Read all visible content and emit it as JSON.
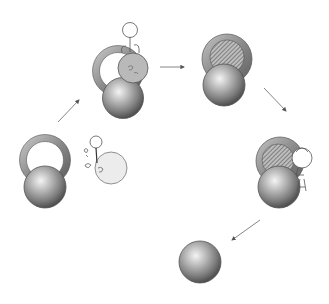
{
  "diagram": {
    "type": "cycle",
    "stages": [
      {
        "id": 1,
        "label": "ring-and-sphere with separate small cell",
        "ring_fill": "open",
        "attached_cell": "separate"
      },
      {
        "id": 2,
        "label": "cell attaching to ring",
        "ring_fill": "open",
        "attached_cell": "merging"
      },
      {
        "id": 3,
        "label": "ring filled (hatched)",
        "ring_fill": "hatched",
        "attached_cell": "none"
      },
      {
        "id": 4,
        "label": "hatched ring with cell at side",
        "ring_fill": "hatched",
        "attached_cell": "side"
      },
      {
        "id": 5,
        "label": "sphere alone",
        "ring_fill": "none",
        "attached_cell": "none"
      }
    ],
    "arrows": [
      {
        "from": 1,
        "to": 2
      },
      {
        "from": 2,
        "to": 3
      },
      {
        "from": 3,
        "to": 4
      },
      {
        "from": 4,
        "to": 5
      }
    ],
    "colors": {
      "sphere_light": "#e8e8e8",
      "sphere_mid": "#9a9a9a",
      "sphere_dark": "#5a5a5a",
      "ring": "#8c8c8c",
      "hatch": "#6e6e6e",
      "cell_fill": "#ececec",
      "outline": "#555555",
      "arrow": "#777777"
    }
  },
  "caption": {
    "visible": "partial (cut off at bottom edge)"
  }
}
